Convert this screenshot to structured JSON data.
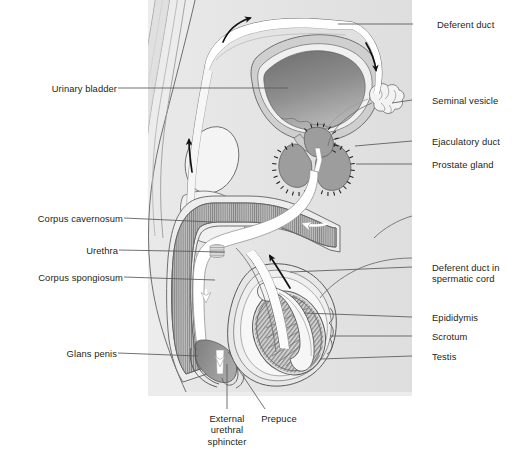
{
  "diagram": {
    "type": "anatomical-illustration",
    "colors": {
      "background_panel": "#ececec",
      "body_fill": "#e4e4e4",
      "organ_light": "#f2f2f2",
      "organ_mid": "#bfbfbf",
      "organ_dark": "#8a8a8a",
      "bladder_interior": "#878787",
      "outline": "#58595b",
      "label_text": "#231f20",
      "leader_line": "#58595b",
      "arrow": "#111111",
      "white_duct": "#ffffff"
    },
    "labels": [
      {
        "id": "deferent-duct",
        "text": "Deferent duct",
        "side": "right",
        "x": 437,
        "y": 19,
        "leader": {
          "x1": 413,
          "y1": 24,
          "x2": 338,
          "y2": 24
        }
      },
      {
        "id": "seminal-vesicle",
        "text": "Seminal vesicle",
        "side": "right",
        "x": 432,
        "y": 95,
        "leader": {
          "x1": 412,
          "y1": 100,
          "x2": 392,
          "y2": 103
        }
      },
      {
        "id": "ejaculatory-duct",
        "text": "Ejaculatory duct",
        "side": "right",
        "x": 432,
        "y": 136,
        "leader": {
          "x1": 412,
          "y1": 141,
          "x2": 355,
          "y2": 146
        }
      },
      {
        "id": "prostate-gland",
        "text": "Prostate gland",
        "side": "right",
        "x": 432,
        "y": 159,
        "leader": {
          "x1": 412,
          "y1": 164,
          "x2": 356,
          "y2": 164
        }
      },
      {
        "id": "deferent-duct-spermatic",
        "text": "Deferent duct in\nspermatic cord",
        "side": "right",
        "x": 432,
        "y": 262,
        "leader": {
          "x1": 412,
          "y1": 267,
          "x2": 290,
          "y2": 272
        }
      },
      {
        "id": "epididymis",
        "text": "Epididymis",
        "side": "right",
        "x": 432,
        "y": 312,
        "leader": {
          "x1": 412,
          "y1": 317,
          "x2": 304,
          "y2": 313
        }
      },
      {
        "id": "scrotum",
        "text": "Scrotum",
        "side": "right",
        "x": 432,
        "y": 331,
        "leader": {
          "x1": 412,
          "y1": 336,
          "x2": 330,
          "y2": 336
        }
      },
      {
        "id": "testis",
        "text": "Testis",
        "side": "right",
        "x": 432,
        "y": 351,
        "leader": {
          "x1": 412,
          "y1": 356,
          "x2": 320,
          "y2": 359
        }
      },
      {
        "id": "urinary-bladder",
        "text": "Urinary bladder",
        "side": "left",
        "x": 37,
        "y": 83,
        "leader": {
          "x1": 118,
          "y1": 88,
          "x2": 288,
          "y2": 88
        }
      },
      {
        "id": "corpus-cavernosum",
        "text": "Corpus cavernosum",
        "side": "left",
        "x": 18,
        "y": 213,
        "leader": {
          "x1": 124,
          "y1": 218,
          "x2": 212,
          "y2": 222
        }
      },
      {
        "id": "urethra",
        "text": "Urethra",
        "side": "left",
        "x": 74,
        "y": 245,
        "leader": {
          "x1": 119,
          "y1": 250,
          "x2": 225,
          "y2": 252
        }
      },
      {
        "id": "corpus-spongiosum",
        "text": "Corpus spongiosum",
        "side": "left",
        "x": 18,
        "y": 272,
        "leader": {
          "x1": 124,
          "y1": 277,
          "x2": 215,
          "y2": 280
        }
      },
      {
        "id": "glans-penis",
        "text": "Glans penis",
        "side": "left",
        "x": 57,
        "y": 348,
        "leader": {
          "x1": 118,
          "y1": 353,
          "x2": 198,
          "y2": 356
        }
      },
      {
        "id": "external-urethral-sphincter",
        "text": "External\nurethral\nsphincter",
        "side": "below",
        "x": 192,
        "y": 413,
        "leader": {
          "x1": 227,
          "y1": 409,
          "x2": 227,
          "y2": 364
        }
      },
      {
        "id": "prepuce",
        "text": "Prepuce",
        "side": "below",
        "x": 258,
        "y": 413,
        "leader": {
          "x1": 265,
          "y1": 409,
          "x2": 237,
          "y2": 367
        }
      }
    ],
    "flow_arrows": [
      {
        "id": "arrow-deferent-up-left",
        "direction": "up",
        "note": "sperm ascending in spermatic cord"
      },
      {
        "id": "arrow-deferent-over-top",
        "direction": "up-right",
        "note": "deferent duct arching over bladder"
      },
      {
        "id": "arrow-deferent-down-right",
        "direction": "down",
        "note": "descending toward seminal vesicle"
      },
      {
        "id": "arrow-urethra-bulb",
        "direction": "left",
        "note": "flow into penile urethra"
      },
      {
        "id": "arrow-epididymis-up",
        "direction": "up-right",
        "note": "from epididymis upward"
      },
      {
        "id": "arrow-glans-exit",
        "direction": "down",
        "note": "exit at external urethral orifice"
      }
    ]
  }
}
